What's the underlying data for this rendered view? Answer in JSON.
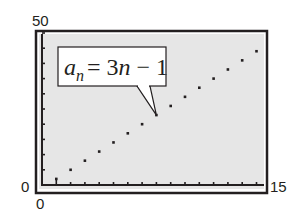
{
  "chart_data": {
    "type": "scatter",
    "title": "",
    "xlabel": "",
    "ylabel": "",
    "xlim": [
      0,
      15
    ],
    "ylim": [
      0,
      50
    ],
    "x_tick_step": 1,
    "y_tick_step": 5,
    "grid": false,
    "axis_labels": {
      "y_max": "50",
      "y_min": "0",
      "x_min": "0",
      "x_max": "15"
    },
    "series": [
      {
        "name": "a_n = 3n − 1",
        "x": [
          1,
          2,
          3,
          4,
          5,
          6,
          7,
          8,
          9,
          10,
          11,
          12,
          13,
          14,
          15
        ],
        "y": [
          2,
          5,
          8,
          11,
          14,
          17,
          20,
          23,
          26,
          29,
          32,
          35,
          38,
          41,
          44
        ]
      }
    ],
    "annotation": {
      "base": "a",
      "subscript": "n",
      "rhs": "= 3n − 1",
      "points_to": {
        "x": 8,
        "y": 23
      }
    }
  },
  "colors": {
    "screen_bg": "#e6e6e6",
    "frame": "#231f20",
    "dot": "#231f20",
    "callout_bg": "#ffffff"
  }
}
